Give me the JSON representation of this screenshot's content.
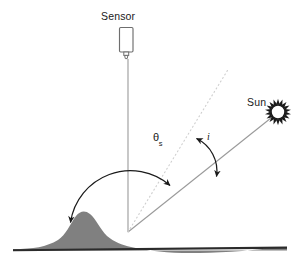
{
  "diagram": {
    "type": "schematic-diagram",
    "width": 303,
    "height": 270,
    "background_color": "#ffffff",
    "labels": {
      "sensor": "Sensor",
      "sun": "Sun",
      "zenith_angle_symbol": "θ",
      "zenith_angle_subscript": "s",
      "incidence_angle": "i"
    },
    "colors": {
      "terrain_fill": "#808080",
      "baseline": "#2b2b2b",
      "ray_line": "#9a9a9a",
      "normal_dotted": "#c9c9c9",
      "arc": "#1a1a1a",
      "sensor_outline": "#6e6e6e",
      "sun_glyph": "#1a1a1a",
      "text": "#1a1a1a"
    },
    "elements": {
      "sensor_body": {
        "shape": "rounded-rectangle",
        "x": 119,
        "y": 27,
        "width": 14,
        "height": 25
      },
      "sensor_nozzle": {
        "shape": "small-cylinder",
        "x": 124,
        "y": 52,
        "width": 5,
        "height": 7
      },
      "convergence_point": {
        "x": 128,
        "y": 232
      },
      "sun_position": {
        "x": 278,
        "y": 112
      },
      "sun_rays_count": 18,
      "sensor_sightline": {
        "x1": 128,
        "y1": 59,
        "x2": 128,
        "y2": 232
      },
      "sun_ray": {
        "x1": 128,
        "y1": 232,
        "x2": 270,
        "y2": 119
      },
      "surface_normal_dotted": {
        "x1": 128,
        "y1": 232,
        "x2": 228,
        "y2": 69
      },
      "baseline": {
        "x1": 13,
        "y1": 250,
        "x2": 287,
        "y2": 247
      },
      "terrain_peak": {
        "x": 78,
        "y": 212
      }
    },
    "arcs": [
      {
        "name": "solar-zenith-angle-arc",
        "label": "θs",
        "from": "sensor vertical line",
        "to": "sun ray",
        "arrowheads": "both",
        "radius": 60
      },
      {
        "name": "incidence-angle-arc",
        "label": "i",
        "from": "surface normal (dotted)",
        "to": "sun ray",
        "arrowheads": "both",
        "radius": 95
      }
    ]
  }
}
